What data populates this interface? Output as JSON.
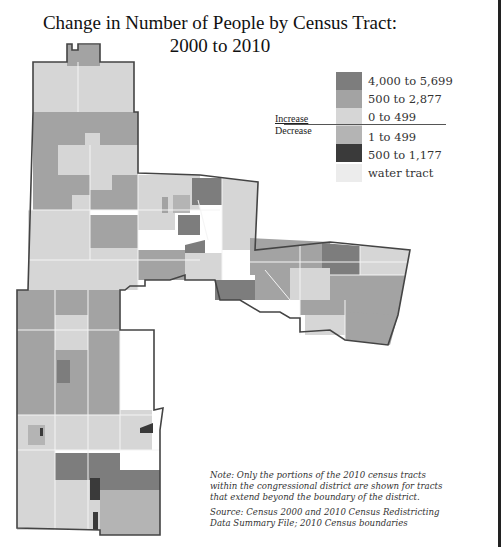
{
  "title": {
    "line1": "Change in Number of People by Census Tract:",
    "line2": "2000 to 2010"
  },
  "legend": {
    "increase_label": "Increase",
    "decrease_label": "Decrease",
    "items": [
      {
        "label": "4,000 to 5,699",
        "category": "increase",
        "color": "#7d7d7d"
      },
      {
        "label": "500 to 2,877",
        "category": "increase",
        "color": "#a3a3a3"
      },
      {
        "label": "0 to 499",
        "category": "increase",
        "color": "#d6d6d6"
      },
      {
        "label": "1 to 499",
        "category": "decrease",
        "color": "#b4b4b4"
      },
      {
        "label": "500 to 1,177",
        "category": "decrease",
        "color": "#3a3a3a"
      },
      {
        "label": "water tract",
        "category": "other",
        "color": "#ececec"
      }
    ]
  },
  "notes": {
    "note": "Note: Only the portions of the 2010 census tracts within the congressional district are shown for tracts that extend beyond the boundary of the district.",
    "note_lines": [
      "Note: Only the portions of the 2010 census tracts",
      "within the congressional district are shown for tracts",
      "that extend beyond the boundary of the district."
    ],
    "source_lines": [
      "Source: Census 2000 and 2010 Census Redistricting",
      "Data Summary File; 2010 Census boundaries"
    ]
  },
  "colors": {
    "boundary": "#444444",
    "tract_line": "#f2f2f2"
  }
}
